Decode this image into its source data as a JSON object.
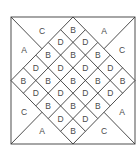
{
  "diagram": {
    "grid_size": 5,
    "lattice_labels": {
      "even": "B",
      "odd": "D"
    },
    "corner_labels": {
      "top_left": {
        "upper": "C",
        "side": "A"
      },
      "top_right": {
        "upper": "A",
        "side": "C"
      },
      "bottom_left": {
        "side": "C",
        "lower": "A"
      },
      "bottom_right": {
        "side": "A",
        "lower": "C"
      }
    },
    "colors": {
      "line": "#3a3a3a",
      "text": "#4a4a4a",
      "background": "#ffffff"
    }
  }
}
